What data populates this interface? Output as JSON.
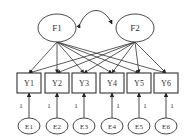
{
  "diagram": {
    "type": "structural-equation-model",
    "factors": [
      {
        "id": "F1",
        "label": "F1",
        "cx": 57,
        "cy": 28
      },
      {
        "id": "F2",
        "label": "F2",
        "cx": 135,
        "cy": 28
      }
    ],
    "indicators": [
      {
        "id": "Y1",
        "label": "Y1",
        "x": 17
      },
      {
        "id": "Y2",
        "label": "Y2",
        "x": 45
      },
      {
        "id": "Y3",
        "label": "Y3",
        "x": 72
      },
      {
        "id": "Y4",
        "label": "Y4",
        "x": 100
      },
      {
        "id": "Y5",
        "label": "Y5",
        "x": 127
      },
      {
        "id": "Y6",
        "label": "Y6",
        "x": 154
      }
    ],
    "errors": [
      {
        "id": "E1",
        "label": "E1",
        "weight": "1"
      },
      {
        "id": "E2",
        "label": "E2",
        "weight": "1"
      },
      {
        "id": "E3",
        "label": "E3",
        "weight": "1"
      },
      {
        "id": "E4",
        "label": "E4",
        "weight": "1"
      },
      {
        "id": "E5",
        "label": "E5",
        "weight": "1"
      },
      {
        "id": "E6",
        "label": "E6",
        "weight": "1"
      }
    ],
    "covariance": {
      "from": "F1",
      "to": "F2"
    },
    "loadings": "every factor loads on every indicator",
    "colors": {
      "stroke": "#333333",
      "background": "#ffffff"
    }
  }
}
